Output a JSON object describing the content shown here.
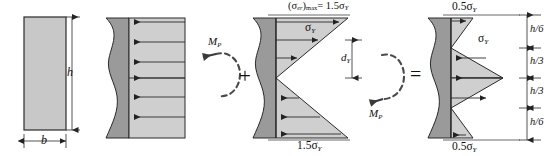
{
  "figure": {
    "type": "residual-stress-superposition-diagram"
  },
  "panel1": {
    "name": "cross-section",
    "width_label": "b",
    "height_label": "h"
  },
  "panel2": {
    "name": "plastic-stress-block",
    "moment_label": "M",
    "moment_sub": "P",
    "arrow_direction": "left",
    "arrow_count": 6
  },
  "operators": {
    "plus": "+",
    "equals": "="
  },
  "panel3": {
    "name": "elastic-stress-distribution",
    "top_label_main": "(σ",
    "top_label_sub": "er",
    "top_label_close": ")",
    "top_label_maxsub": "max",
    "top_label_value": "= 1.5σ",
    "top_label_valsub": "Y",
    "sigma_label": "σ",
    "sigma_sub": "Y",
    "depth_label": "d",
    "depth_sub": "Y",
    "bottom_label": "1.5σ",
    "bottom_sub": "Y",
    "moment_label": "M",
    "moment_sub": "P"
  },
  "panel4": {
    "name": "residual-stress-distribution",
    "top_label": "0.5σ",
    "top_sub": "Y",
    "sigma_label": "σ",
    "sigma_sub": "Y",
    "bottom_label": "0.5σ",
    "bottom_sub": "Y",
    "dimensions": [
      {
        "label": "h/6",
        "num": "h",
        "den": "6"
      },
      {
        "label": "h/3",
        "num": "h",
        "den": "3"
      },
      {
        "label": "h/3",
        "num": "h",
        "den": "3"
      },
      {
        "label": "h/6",
        "num": "h",
        "den": "6"
      }
    ]
  },
  "colors": {
    "body_fill": "#9a9a9a",
    "stress_fill": "#cfcfcf",
    "line": "#222222",
    "white": "#ffffff"
  }
}
